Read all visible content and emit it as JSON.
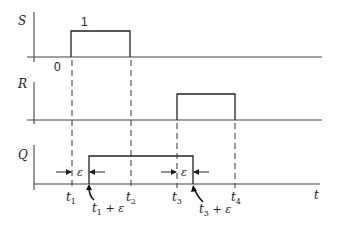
{
  "figure": {
    "type": "timing-diagram",
    "signals": [
      {
        "name": "S",
        "label": "S",
        "high_label": "1",
        "origin_label": "0",
        "high_from": "t1",
        "high_to": "t2"
      },
      {
        "name": "R",
        "label": "R",
        "high_from": "t3",
        "high_to": "t4"
      },
      {
        "name": "Q",
        "label": "Q",
        "high_from": "t1 + ε",
        "high_to": "t3 + ε"
      }
    ],
    "time_axis_label": "t",
    "time_marks": [
      {
        "id": "t1",
        "base": "t",
        "sub": "1"
      },
      {
        "id": "t2",
        "base": "t",
        "sub": "2"
      },
      {
        "id": "t3",
        "base": "t",
        "sub": "3"
      },
      {
        "id": "t4",
        "base": "t",
        "sub": "4"
      }
    ],
    "delay_annotations": [
      {
        "base": "t",
        "sub": "1",
        "suffix": " + ε"
      },
      {
        "base": "t",
        "sub": "3",
        "suffix": " + ε"
      }
    ],
    "epsilon_symbol": "ε"
  }
}
